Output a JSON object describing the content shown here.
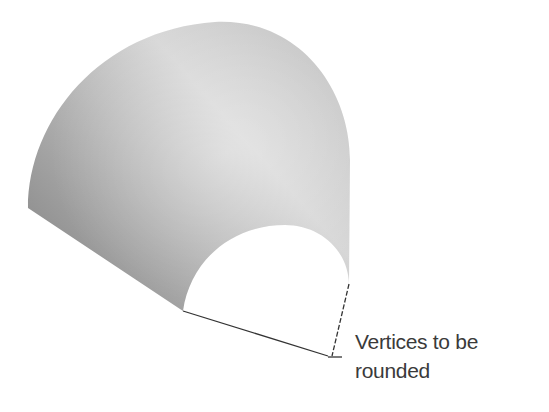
{
  "figure": {
    "colors": {
      "background": "#ffffff",
      "surface_dark": "#8c8c8c",
      "surface_mid": "#bdbdbd",
      "surface_light": "#e2e2e2",
      "edge_line": "#333333",
      "label_text": "#3a3a3a"
    }
  },
  "annotation": {
    "line1": "Vertices to be",
    "line2": "rounded"
  }
}
